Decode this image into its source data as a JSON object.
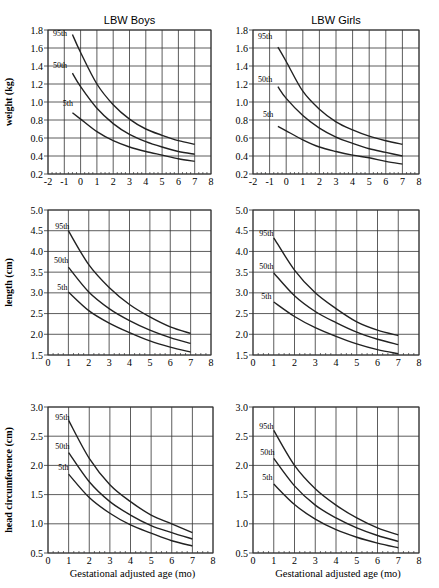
{
  "figure": {
    "column_titles": [
      "LBW Boys",
      "LBW Girls"
    ],
    "row_ylabels": [
      "weight (kg)",
      "length (cm)",
      "head circumference (cm)"
    ],
    "xlabel": "Gestational adjusted age (mo)",
    "line_color": "#222222",
    "grid_color": "#333333"
  },
  "chart_data": [
    {
      "type": "line",
      "title": "LBW Boys",
      "ylabel": "weight (kg)",
      "xlabel": "",
      "xlim": [
        -2,
        8
      ],
      "ylim": [
        0.2,
        1.8
      ],
      "xticks": [
        -2,
        -1,
        0,
        1,
        2,
        3,
        4,
        5,
        6,
        7,
        8
      ],
      "yticks": [
        "0.2",
        "0.4",
        "0.6",
        "0.8",
        "1.0",
        "1.2",
        "1.4",
        "1.6",
        "1.8"
      ],
      "grid": true,
      "x": [
        -0.5,
        0,
        1,
        2,
        3,
        4,
        5,
        6,
        7
      ],
      "series": [
        {
          "name": "95th",
          "label_pos": [
            -1.7,
            1.73
          ],
          "values": [
            1.75,
            1.55,
            1.2,
            0.97,
            0.81,
            0.7,
            0.63,
            0.57,
            0.53
          ]
        },
        {
          "name": "50th",
          "label_pos": [
            -1.7,
            1.38
          ],
          "values": [
            1.32,
            1.17,
            0.93,
            0.76,
            0.64,
            0.56,
            0.5,
            0.45,
            0.42
          ]
        },
        {
          "name": "5th",
          "label_pos": [
            -1.1,
            0.96
          ],
          "values": [
            0.88,
            0.81,
            0.67,
            0.57,
            0.5,
            0.45,
            0.41,
            0.37,
            0.34
          ]
        }
      ]
    },
    {
      "type": "line",
      "title": "LBW Girls",
      "ylabel": "",
      "xlabel": "",
      "xlim": [
        -2,
        8
      ],
      "ylim": [
        0.2,
        1.8
      ],
      "xticks": [
        -2,
        -1,
        0,
        1,
        2,
        3,
        4,
        5,
        6,
        7,
        8
      ],
      "yticks": [
        "0.2",
        "0.4",
        "0.6",
        "0.8",
        "1.0",
        "1.2",
        "1.4",
        "1.6",
        "1.8"
      ],
      "grid": true,
      "x": [
        -0.5,
        0,
        1,
        2,
        3,
        4,
        5,
        6,
        7
      ],
      "series": [
        {
          "name": "95th",
          "label_pos": [
            -1.7,
            1.7
          ],
          "values": [
            1.61,
            1.45,
            1.12,
            0.92,
            0.78,
            0.69,
            0.62,
            0.57,
            0.53
          ]
        },
        {
          "name": "50th",
          "label_pos": [
            -1.7,
            1.22
          ],
          "values": [
            1.17,
            1.04,
            0.85,
            0.71,
            0.61,
            0.54,
            0.48,
            0.44,
            0.4
          ]
        },
        {
          "name": "5th",
          "label_pos": [
            -1.4,
            0.83
          ],
          "values": [
            0.73,
            0.68,
            0.58,
            0.5,
            0.45,
            0.41,
            0.38,
            0.34,
            0.31
          ]
        }
      ]
    },
    {
      "type": "line",
      "title": "",
      "ylabel": "length (cm)",
      "xlabel": "",
      "xlim": [
        0,
        8
      ],
      "ylim": [
        1.5,
        5.0
      ],
      "xticks": [
        0,
        1,
        2,
        3,
        4,
        5,
        6,
        7,
        8
      ],
      "yticks": [
        "1.5",
        "2.0",
        "2.5",
        "3.0",
        "3.5",
        "4.0",
        "4.5",
        "5.0"
      ],
      "grid": true,
      "x": [
        1,
        2,
        3,
        4,
        5,
        6,
        7
      ],
      "series": [
        {
          "name": "95th",
          "label_pos": [
            0.35,
            4.55
          ],
          "values": [
            4.5,
            3.68,
            3.13,
            2.72,
            2.42,
            2.18,
            2.02
          ]
        },
        {
          "name": "50th",
          "label_pos": [
            0.3,
            3.72
          ],
          "values": [
            3.62,
            3.02,
            2.62,
            2.33,
            2.1,
            1.92,
            1.78
          ]
        },
        {
          "name": "5th",
          "label_pos": [
            0.45,
            3.08
          ],
          "values": [
            3.02,
            2.57,
            2.27,
            2.04,
            1.84,
            1.69,
            1.57
          ]
        }
      ]
    },
    {
      "type": "line",
      "title": "",
      "ylabel": "",
      "xlabel": "",
      "xlim": [
        0,
        8
      ],
      "ylim": [
        1.5,
        5.0
      ],
      "xticks": [
        0,
        1,
        2,
        3,
        4,
        5,
        6,
        7,
        8
      ],
      "yticks": [
        "1.5",
        "2.0",
        "2.5",
        "3.0",
        "3.5",
        "4.0",
        "4.5",
        "5.0"
      ],
      "grid": true,
      "x": [
        1,
        2,
        3,
        4,
        5,
        6,
        7
      ],
      "series": [
        {
          "name": "95th",
          "label_pos": [
            0.3,
            4.38
          ],
          "values": [
            4.33,
            3.55,
            3.0,
            2.62,
            2.3,
            2.1,
            1.97
          ]
        },
        {
          "name": "50th",
          "label_pos": [
            0.3,
            3.58
          ],
          "values": [
            3.48,
            2.93,
            2.55,
            2.28,
            2.05,
            1.88,
            1.75
          ]
        },
        {
          "name": "5th",
          "label_pos": [
            0.4,
            2.85
          ],
          "values": [
            2.78,
            2.43,
            2.16,
            1.95,
            1.77,
            1.63,
            1.53
          ]
        }
      ]
    },
    {
      "type": "line",
      "title": "",
      "ylabel": "head circumference (cm)",
      "xlabel": "Gestational adjusted age (mo)",
      "xlim": [
        0,
        8
      ],
      "ylim": [
        0.5,
        3.0
      ],
      "xticks": [
        0,
        1,
        2,
        3,
        4,
        5,
        6,
        7,
        8
      ],
      "yticks": [
        "0.5",
        "1.0",
        "1.5",
        "2.0",
        "2.5",
        "3.0"
      ],
      "grid": true,
      "x": [
        1,
        2,
        3,
        4,
        5,
        6,
        7
      ],
      "series": [
        {
          "name": "95th",
          "label_pos": [
            0.35,
            2.78
          ],
          "values": [
            2.77,
            2.12,
            1.67,
            1.38,
            1.15,
            1.0,
            0.85
          ]
        },
        {
          "name": "50th",
          "label_pos": [
            0.35,
            2.28
          ],
          "values": [
            2.22,
            1.72,
            1.38,
            1.15,
            0.97,
            0.85,
            0.74
          ]
        },
        {
          "name": "5th",
          "label_pos": [
            0.5,
            1.92
          ],
          "values": [
            1.85,
            1.45,
            1.18,
            0.98,
            0.84,
            0.71,
            0.62
          ]
        }
      ]
    },
    {
      "type": "line",
      "title": "",
      "ylabel": "",
      "xlabel": "Gestational adjusted age (mo)",
      "xlim": [
        0,
        8
      ],
      "ylim": [
        0.5,
        3.0
      ],
      "xticks": [
        0,
        1,
        2,
        3,
        4,
        5,
        6,
        7,
        8
      ],
      "yticks": [
        "0.5",
        "1.0",
        "1.5",
        "2.0",
        "2.5",
        "3.0"
      ],
      "grid": true,
      "x": [
        1,
        2,
        3,
        4,
        5,
        6,
        7
      ],
      "series": [
        {
          "name": "95th",
          "label_pos": [
            0.3,
            2.62
          ],
          "values": [
            2.6,
            2.0,
            1.6,
            1.32,
            1.1,
            0.93,
            0.81
          ]
        },
        {
          "name": "50th",
          "label_pos": [
            0.35,
            2.17
          ],
          "values": [
            2.12,
            1.65,
            1.32,
            1.1,
            0.93,
            0.8,
            0.7
          ]
        },
        {
          "name": "5th",
          "label_pos": [
            0.45,
            1.75
          ],
          "values": [
            1.68,
            1.33,
            1.08,
            0.9,
            0.77,
            0.67,
            0.59
          ]
        }
      ]
    }
  ]
}
